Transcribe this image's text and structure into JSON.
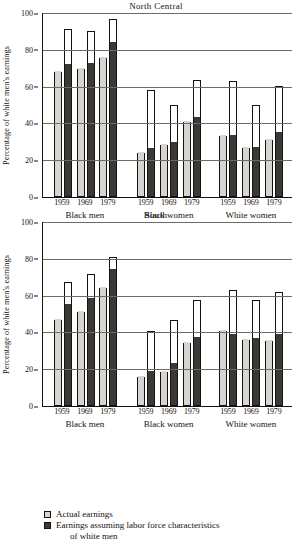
{
  "chart_data": [
    {
      "type": "bar",
      "title": "North Central",
      "xlabel": "",
      "ylabel": "Percentage of white men's earnings",
      "ylim": [
        0,
        100
      ],
      "yticks": [
        0,
        20,
        40,
        60,
        80,
        100
      ],
      "grid": true,
      "legend_position": "bottom",
      "groups": [
        "Black men",
        "Black women",
        "White women"
      ],
      "categories": [
        "1959",
        "1969",
        "1979"
      ],
      "series": [
        {
          "name": "Actual earnings",
          "values": {
            "Black men": [
              68,
              69.5,
              75.5
            ],
            "Black women": [
              24,
              28,
              41
            ],
            "White women": [
              33,
              26.5,
              31
            ]
          }
        },
        {
          "name": "Earnings assuming labor force characteristics of white men",
          "values": {
            "Black men": [
              71.5,
              72.5,
              83.5
            ],
            "Black women": [
              26,
              29.5,
              43
            ],
            "White women": [
              33,
              26.5,
              35
            ]
          }
        }
      ],
      "outline_tops": {
        "Actual earnings": {
          "Black men": [
            68,
            69.5,
            75.5
          ],
          "Black women": [
            24,
            28,
            41
          ],
          "White women": [
            33,
            26.5,
            31
          ]
        },
        "Earnings assuming labor force characteristics of white men": {
          "Black men": [
            91.5,
            90,
            96.5
          ],
          "Black women": [
            58,
            50,
            63.5
          ],
          "White women": [
            63,
            50,
            60.5
          ]
        }
      }
    },
    {
      "type": "bar",
      "title": "South",
      "xlabel": "",
      "ylabel": "Percentage of white men's earnings",
      "ylim": [
        0,
        100
      ],
      "yticks": [
        0,
        20,
        40,
        60,
        80,
        100
      ],
      "grid": true,
      "legend_position": "bottom",
      "groups": [
        "Black men",
        "Black women",
        "White women"
      ],
      "categories": [
        "1959",
        "1969",
        "1979"
      ],
      "series": [
        {
          "name": "Actual earnings",
          "values": {
            "Black men": [
              47,
              51,
              64
            ],
            "Black women": [
              16,
              18.5,
              34
            ],
            "White women": [
              41,
              36,
              35.5
            ]
          }
        },
        {
          "name": "Earnings assuming labor force characteristics of white men",
          "values": {
            "Black men": [
              55,
              58,
              74
            ],
            "Black women": [
              18.5,
              23,
              37
            ],
            "White women": [
              38.5,
              36.5,
              38.5
            ]
          }
        }
      ],
      "outline_tops": {
        "Actual earnings": {
          "Black men": [
            47,
            51,
            64
          ],
          "Black women": [
            16,
            18.5,
            34
          ],
          "White women": [
            41,
            36,
            35.5
          ]
        },
        "Earnings assuming labor force characteristics of white men": {
          "Black men": [
            67.5,
            72,
            81
          ],
          "Black women": [
            41,
            46.5,
            57.5
          ],
          "White women": [
            63,
            57.5,
            62
          ]
        }
      }
    }
  ],
  "charts": [
    {
      "title": "North Central",
      "ylabel": "Percentage of white men's earnings",
      "yticks": [
        "100",
        "80",
        "60",
        "40",
        "20",
        "0"
      ],
      "groups": [
        {
          "name": "Black men",
          "years": [
            {
              "year": "1959",
              "light_fill": 68,
              "light_top": 68,
              "dark_fill": 71.5,
              "dark_top": 91.5
            },
            {
              "year": "1969",
              "light_fill": 69.5,
              "light_top": 69.5,
              "dark_fill": 72.5,
              "dark_top": 90
            },
            {
              "year": "1979",
              "light_fill": 75.5,
              "light_top": 75.5,
              "dark_fill": 83.5,
              "dark_top": 96.5
            }
          ]
        },
        {
          "name": "Black women",
          "years": [
            {
              "year": "1959",
              "light_fill": 24,
              "light_top": 24,
              "dark_fill": 26,
              "dark_top": 58
            },
            {
              "year": "1969",
              "light_fill": 28,
              "light_top": 28,
              "dark_fill": 29.5,
              "dark_top": 50
            },
            {
              "year": "1979",
              "light_fill": 41,
              "light_top": 41,
              "dark_fill": 43,
              "dark_top": 63.5
            }
          ]
        },
        {
          "name": "White women",
          "years": [
            {
              "year": "1959",
              "light_fill": 33,
              "light_top": 33,
              "dark_fill": 33,
              "dark_top": 63
            },
            {
              "year": "1969",
              "light_fill": 26.5,
              "light_top": 26.5,
              "dark_fill": 26.5,
              "dark_top": 50
            },
            {
              "year": "1979",
              "light_fill": 31,
              "light_top": 31,
              "dark_fill": 35,
              "dark_top": 60.5
            }
          ]
        }
      ]
    },
    {
      "title": "South",
      "ylabel": "Percentage of white men's earnings",
      "yticks": [
        "100",
        "80",
        "60",
        "40",
        "20",
        "0"
      ],
      "groups": [
        {
          "name": "Black men",
          "years": [
            {
              "year": "1959",
              "light_fill": 47,
              "light_top": 47,
              "dark_fill": 55,
              "dark_top": 67.5
            },
            {
              "year": "1969",
              "light_fill": 51,
              "light_top": 51,
              "dark_fill": 58,
              "dark_top": 72
            },
            {
              "year": "1979",
              "light_fill": 64,
              "light_top": 64,
              "dark_fill": 74,
              "dark_top": 81
            }
          ]
        },
        {
          "name": "Black women",
          "years": [
            {
              "year": "1959",
              "light_fill": 16,
              "light_top": 16,
              "dark_fill": 18.5,
              "dark_top": 41
            },
            {
              "year": "1969",
              "light_fill": 18.5,
              "light_top": 18.5,
              "dark_fill": 23,
              "dark_top": 46.5
            },
            {
              "year": "1979",
              "light_fill": 34,
              "light_top": 34,
              "dark_fill": 37,
              "dark_top": 57.5
            }
          ]
        },
        {
          "name": "White women",
          "years": [
            {
              "year": "1959",
              "light_fill": 41,
              "light_top": 41,
              "dark_fill": 38.5,
              "dark_top": 63
            },
            {
              "year": "1969",
              "light_fill": 36,
              "light_top": 36,
              "dark_fill": 36.5,
              "dark_top": 57.5
            },
            {
              "year": "1979",
              "light_fill": 35.5,
              "light_top": 35.5,
              "dark_fill": 38.5,
              "dark_top": 62
            }
          ]
        }
      ]
    }
  ],
  "legend": {
    "items": [
      {
        "swatch": "light",
        "label": "Actual earnings",
        "label2": ""
      },
      {
        "swatch": "dark",
        "label": "Earnings assuming labor force characteristics",
        "label2": "of white men"
      }
    ]
  }
}
